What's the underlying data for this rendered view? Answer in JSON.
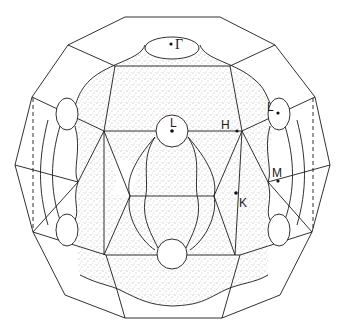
{
  "figure": {
    "labels": {
      "gamma": "Γ",
      "L_center": "L",
      "L_right": "L",
      "H": "H",
      "K": "K",
      "M": "M"
    },
    "colors": {
      "line": "#1a1a1a",
      "stipple": "#555555",
      "background": "#ffffff"
    }
  }
}
